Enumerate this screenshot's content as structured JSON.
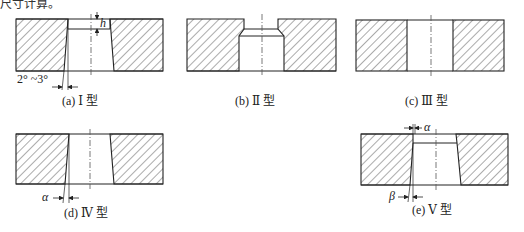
{
  "header_fragment": "尺寸计算。",
  "figures": [
    {
      "id": "a",
      "caption": "(a) Ⅰ 型",
      "labels": {
        "h": "h",
        "angle": "2° ~3°"
      }
    },
    {
      "id": "b",
      "caption": "(b) Ⅱ 型"
    },
    {
      "id": "c",
      "caption": "(c) Ⅲ 型"
    },
    {
      "id": "d",
      "caption": "(d) Ⅳ 型",
      "labels": {
        "alpha": "α"
      }
    },
    {
      "id": "e",
      "caption": "(e) Ⅴ 型",
      "labels": {
        "alpha": "α",
        "beta": "β"
      }
    }
  ],
  "colors": {
    "line": "#222222",
    "hatch": "#444444",
    "background": "#ffffff"
  }
}
